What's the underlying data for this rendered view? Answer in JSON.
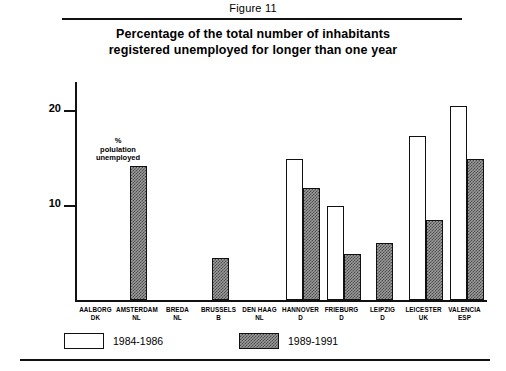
{
  "figure": {
    "caption": "Figure 11"
  },
  "chart_data": {
    "type": "bar",
    "title": "Percentage of the total number of inhabitants registered unemployed for longer than one year",
    "title_lines": [
      "Percentage of the total number of inhabitants",
      "registered unemployed for longer than one year"
    ],
    "xlabel": "",
    "ylabel": "% polulation unemployed",
    "ylabel_lines": [
      "%",
      "polulation",
      "unemployed"
    ],
    "ylim": [
      0,
      23
    ],
    "yticks": [
      10,
      20
    ],
    "ytick_labels": [
      "10",
      "20"
    ],
    "grid": false,
    "legend_position": "below-axis",
    "categories": [
      "AALBORG DK",
      "AMSTERDAM NL",
      "BREDA NL",
      "BRUSSELS B",
      "DEN HAAG NL",
      "HANNOVER D",
      "FRIEBURG D",
      "LEIPZIG D",
      "LEICESTER UK",
      "VALENCIA ESP"
    ],
    "category_lines": [
      [
        "AALBORG",
        "DK"
      ],
      [
        "AMSTERDAM",
        "NL"
      ],
      [
        "BREDA",
        "NL"
      ],
      [
        "BRUSSELS",
        "B"
      ],
      [
        "DEN HAAG",
        "NL"
      ],
      [
        "HANNOVER",
        "D"
      ],
      [
        "FRIEBURG",
        "D"
      ],
      [
        "LEIPZIG",
        "D"
      ],
      [
        "LEICESTER",
        "UK"
      ],
      [
        "VALENCIA",
        "ESP"
      ]
    ],
    "series": [
      {
        "name": "1984-1986",
        "style": "open",
        "color": "#ffffff",
        "values": [
          null,
          null,
          null,
          null,
          null,
          14.9,
          9.9,
          null,
          17.3,
          20.5
        ]
      },
      {
        "name": "1989-1991",
        "style": "hatched",
        "color": "#9d9d9d",
        "values": [
          null,
          14.1,
          null,
          4.4,
          null,
          11.8,
          4.9,
          6.0,
          8.4,
          14.9
        ]
      }
    ]
  },
  "legend": {
    "items": [
      {
        "label": "1984-1986",
        "style": "open"
      },
      {
        "label": "1989-1991",
        "style": "hatched"
      }
    ]
  }
}
